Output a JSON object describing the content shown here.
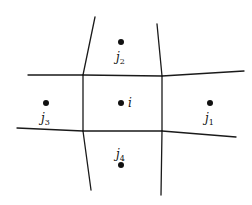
{
  "diagram": {
    "type": "finite-volume-stencil",
    "edges": [
      {
        "name": "top-left-edge",
        "x1": 95,
        "y1": 17,
        "x2": 83,
        "y2": 75
      },
      {
        "name": "top-right-edge",
        "x1": 157,
        "y1": 24,
        "x2": 162,
        "y2": 76
      },
      {
        "name": "upper-left-edge",
        "x1": 28,
        "y1": 75,
        "x2": 83,
        "y2": 75
      },
      {
        "name": "upper-mid-edge",
        "x1": 83,
        "y1": 75,
        "x2": 162,
        "y2": 76
      },
      {
        "name": "upper-right-edge",
        "x1": 162,
        "y1": 76,
        "x2": 244,
        "y2": 71
      },
      {
        "name": "mid-left-vert",
        "x1": 83,
        "y1": 75,
        "x2": 83,
        "y2": 131
      },
      {
        "name": "mid-right-vert",
        "x1": 162,
        "y1": 76,
        "x2": 162,
        "y2": 131
      },
      {
        "name": "lower-left-edge",
        "x1": 17,
        "y1": 128,
        "x2": 83,
        "y2": 131
      },
      {
        "name": "lower-mid-edge",
        "x1": 83,
        "y1": 131,
        "x2": 162,
        "y2": 131
      },
      {
        "name": "lower-right-edge",
        "x1": 162,
        "y1": 131,
        "x2": 236,
        "y2": 137
      },
      {
        "name": "bottom-left-edge",
        "x1": 83,
        "y1": 131,
        "x2": 91,
        "y2": 190
      },
      {
        "name": "bottom-right-edge",
        "x1": 162,
        "y1": 131,
        "x2": 161,
        "y2": 195
      }
    ],
    "nodes": [
      {
        "name": "node-i",
        "cx": 121,
        "cy": 103,
        "label": "i",
        "sub": "",
        "lx": 128,
        "ly": 107
      },
      {
        "name": "node-j1",
        "cx": 210,
        "cy": 103,
        "label": "j",
        "sub": "1",
        "lx": 205,
        "ly": 122
      },
      {
        "name": "node-j2",
        "cx": 121,
        "cy": 42,
        "label": "j",
        "sub": "2",
        "lx": 116,
        "ly": 61
      },
      {
        "name": "node-j3",
        "cx": 46,
        "cy": 103,
        "label": "j",
        "sub": "3",
        "lx": 41,
        "ly": 122
      },
      {
        "name": "node-j4",
        "cx": 121,
        "cy": 165,
        "label": "j",
        "sub": "4",
        "lx": 116,
        "ly": 158
      }
    ]
  }
}
